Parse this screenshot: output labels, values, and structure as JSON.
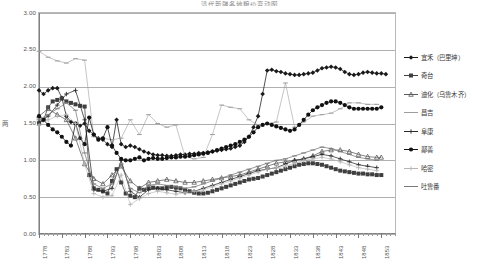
{
  "chart_data": {
    "type": "line",
    "title": "清代新疆各地粮价变动图",
    "xlabel": "",
    "ylabel": "两",
    "ylim": [
      0,
      3.0
    ],
    "xlim": [
      1778,
      1856
    ],
    "grid": true,
    "legend_position": "right",
    "ytick_labels": [
      "0.00",
      "0.50",
      "1.00",
      "1.50",
      "2.00",
      "2.50",
      "3.00"
    ],
    "ytick_values": [
      0.0,
      0.5,
      1.0,
      1.5,
      2.0,
      2.5,
      3.0
    ],
    "xtick_labels": [
      "1778",
      "1783",
      "1788",
      "1793",
      "1798",
      "1803",
      "1808",
      "1813",
      "1818",
      "1823",
      "1828",
      "1833",
      "1838",
      "1843",
      "1848",
      "1853"
    ],
    "xtick_values": [
      1778,
      1783,
      1788,
      1793,
      1798,
      1803,
      1808,
      1813,
      1818,
      1823,
      1828,
      1833,
      1838,
      1843,
      1848,
      1853
    ],
    "series": [
      {
        "name": "宜禾（巴里坤）",
        "marker": "diamond",
        "color": "#1a1a1a",
        "x": [
          1778,
          1779,
          1780,
          1781,
          1782,
          1783,
          1784,
          1785,
          1786,
          1787,
          1788,
          1789,
          1790,
          1791,
          1792,
          1793,
          1794,
          1795,
          1796,
          1797,
          1798,
          1799,
          1800,
          1801,
          1802,
          1803,
          1804,
          1805,
          1806,
          1807,
          1808,
          1809,
          1810,
          1811,
          1812,
          1813,
          1814,
          1815,
          1816,
          1817,
          1818,
          1819,
          1820,
          1821,
          1822,
          1823,
          1824,
          1825,
          1826,
          1827,
          1828,
          1829,
          1830,
          1831,
          1832,
          1833,
          1834,
          1835,
          1836,
          1837,
          1838,
          1839,
          1840,
          1841,
          1842,
          1843,
          1844,
          1845,
          1846,
          1847,
          1848,
          1849,
          1850,
          1851,
          1852,
          1853,
          1854
        ],
        "y": [
          1.95,
          1.9,
          1.95,
          1.98,
          1.98,
          1.85,
          1.6,
          1.52,
          1.5,
          1.47,
          1.5,
          1.4,
          1.35,
          1.3,
          1.28,
          1.22,
          1.18,
          1.55,
          1.22,
          1.18,
          1.2,
          1.18,
          1.15,
          1.12,
          1.1,
          1.08,
          1.07,
          1.07,
          1.06,
          1.06,
          1.07,
          1.08,
          1.08,
          1.09,
          1.09,
          1.1,
          1.1,
          1.11,
          1.12,
          1.13,
          1.14,
          1.15,
          1.16,
          1.18,
          1.2,
          1.25,
          1.32,
          1.45,
          1.6,
          1.9,
          2.22,
          2.23,
          2.21,
          2.2,
          2.18,
          2.17,
          2.16,
          2.16,
          2.17,
          2.18,
          2.19,
          2.22,
          2.25,
          2.26,
          2.27,
          2.26,
          2.24,
          2.2,
          2.17,
          2.16,
          2.17,
          2.19,
          2.2,
          2.19,
          2.18,
          2.18,
          2.17
        ]
      },
      {
        "name": "奇台",
        "marker": "square",
        "color": "#3f3f3f",
        "x": [
          1778,
          1779,
          1780,
          1781,
          1782,
          1783,
          1784,
          1785,
          1786,
          1787,
          1788,
          1789,
          1790,
          1791,
          1792,
          1793,
          1794,
          1795,
          1796,
          1797,
          1798,
          1799,
          1800,
          1801,
          1802,
          1803,
          1804,
          1805,
          1806,
          1807,
          1808,
          1809,
          1810,
          1811,
          1812,
          1813,
          1814,
          1815,
          1816,
          1817,
          1818,
          1819,
          1820,
          1821,
          1822,
          1823,
          1824,
          1825,
          1826,
          1827,
          1828,
          1829,
          1830,
          1831,
          1832,
          1833,
          1834,
          1835,
          1836,
          1837,
          1838,
          1839,
          1840,
          1841,
          1842,
          1843,
          1844,
          1845,
          1846,
          1847,
          1848,
          1849,
          1850,
          1851,
          1852,
          1853
        ],
        "y": [
          1.5,
          1.55,
          1.72,
          1.8,
          1.82,
          1.84,
          1.8,
          1.78,
          1.76,
          1.74,
          1.73,
          0.8,
          0.62,
          0.6,
          0.58,
          0.55,
          0.72,
          0.88,
          0.7,
          0.55,
          0.52,
          0.5,
          0.62,
          0.6,
          0.62,
          0.63,
          0.62,
          0.62,
          0.63,
          0.64,
          0.63,
          0.62,
          0.6,
          0.58,
          0.56,
          0.55,
          0.55,
          0.56,
          0.58,
          0.6,
          0.62,
          0.64,
          0.66,
          0.68,
          0.7,
          0.72,
          0.74,
          0.75,
          0.76,
          0.78,
          0.8,
          0.82,
          0.84,
          0.86,
          0.88,
          0.9,
          0.92,
          0.94,
          0.95,
          0.96,
          0.96,
          0.95,
          0.94,
          0.92,
          0.9,
          0.88,
          0.86,
          0.85,
          0.84,
          0.83,
          0.82,
          0.82,
          0.81,
          0.81,
          0.8,
          0.8
        ]
      },
      {
        "name": "迪化（乌鲁木齐）",
        "marker": "tri-small",
        "color": "#5a5a5a",
        "x": [
          1778,
          1780,
          1782,
          1784,
          1786,
          1788,
          1790,
          1792,
          1794,
          1796,
          1798,
          1800,
          1802,
          1804,
          1806,
          1808,
          1810,
          1812,
          1814,
          1816,
          1818,
          1820,
          1822,
          1824,
          1826,
          1828,
          1830,
          1832,
          1834,
          1836,
          1838,
          1840,
          1842,
          1844,
          1846,
          1848,
          1850,
          1852,
          1853
        ],
        "y": [
          1.6,
          1.7,
          1.62,
          1.55,
          1.3,
          0.95,
          0.75,
          0.68,
          0.8,
          0.92,
          0.72,
          0.62,
          0.7,
          0.72,
          0.74,
          0.72,
          0.7,
          0.7,
          0.72,
          0.74,
          0.76,
          0.78,
          0.8,
          0.84,
          0.88,
          0.92,
          0.96,
          0.98,
          1.0,
          1.02,
          1.06,
          1.12,
          1.14,
          1.14,
          1.12,
          1.08,
          1.05,
          1.04,
          1.04
        ]
      },
      {
        "name": "昌吉",
        "marker": "faint-dash",
        "color": "#9d9d9d",
        "x": [
          1778,
          1780,
          1782,
          1784,
          1786,
          1788,
          1790,
          1792,
          1794,
          1796,
          1798,
          1800,
          1802,
          1804,
          1806,
          1808,
          1810,
          1812,
          1814,
          1816,
          1818,
          1820,
          1822,
          1824,
          1826,
          1828,
          1830,
          1832,
          1834,
          1836,
          1838,
          1840,
          1842,
          1844,
          1846,
          1848,
          1850,
          1852
        ],
        "y": [
          2.48,
          2.4,
          2.35,
          2.32,
          2.38,
          2.36,
          1.32,
          1.3,
          1.28,
          1.3,
          1.55,
          1.35,
          1.62,
          1.5,
          1.45,
          1.48,
          1.05,
          1.02,
          1.04,
          1.35,
          1.75,
          1.72,
          1.7,
          1.55,
          1.48,
          1.5,
          1.52,
          2.05,
          1.45,
          1.52,
          1.6,
          1.62,
          1.64,
          1.7,
          1.78,
          1.78,
          1.76,
          1.76
        ]
      },
      {
        "name": "阜康",
        "marker": "plus",
        "color": "#2b2b2b",
        "x": [
          1778,
          1780,
          1782,
          1784,
          1786,
          1788,
          1790,
          1792,
          1794,
          1796,
          1798,
          1800,
          1802,
          1804,
          1806,
          1808,
          1810,
          1812,
          1814,
          1816,
          1818,
          1820,
          1822,
          1824,
          1826,
          1828,
          1830,
          1832,
          1834,
          1836,
          1838,
          1840,
          1842,
          1844,
          1846,
          1848,
          1850,
          1852
        ],
        "y": [
          1.52,
          1.6,
          1.75,
          1.9,
          1.95,
          1.55,
          0.6,
          0.58,
          0.62,
          1.0,
          0.58,
          0.5,
          0.6,
          0.62,
          0.6,
          0.58,
          0.56,
          0.58,
          0.62,
          0.66,
          0.7,
          0.74,
          0.78,
          0.82,
          0.86,
          0.88,
          0.9,
          0.95,
          1.0,
          1.02,
          1.05,
          1.08,
          1.06,
          1.02,
          0.98,
          0.94,
          0.92,
          0.9
        ]
      },
      {
        "name": "鄯善",
        "marker": "circle",
        "color": "#111111",
        "x": [
          1778,
          1779,
          1780,
          1781,
          1782,
          1783,
          1784,
          1785,
          1786,
          1787,
          1788,
          1789,
          1790,
          1791,
          1792,
          1793,
          1794,
          1795,
          1796,
          1797,
          1798,
          1799,
          1800,
          1801,
          1802,
          1803,
          1804,
          1805,
          1806,
          1807,
          1808,
          1809,
          1810,
          1811,
          1812,
          1813,
          1814,
          1815,
          1816,
          1817,
          1818,
          1819,
          1820,
          1821,
          1822,
          1823,
          1824,
          1825,
          1826,
          1827,
          1828,
          1829,
          1830,
          1831,
          1832,
          1833,
          1834,
          1835,
          1836,
          1837,
          1838,
          1839,
          1840,
          1841,
          1842,
          1843,
          1844,
          1845,
          1846,
          1847,
          1848,
          1849,
          1850,
          1851,
          1852,
          1853
        ],
        "y": [
          1.6,
          1.55,
          1.48,
          1.42,
          1.38,
          1.32,
          1.25,
          1.2,
          1.5,
          1.3,
          1.22,
          1.58,
          1.35,
          1.28,
          1.3,
          1.45,
          1.2,
          1.1,
          1.02,
          1.0,
          1.0,
          1.02,
          1.04,
          1.0,
          1.02,
          1.03,
          1.02,
          1.02,
          1.03,
          1.04,
          1.04,
          1.05,
          1.05,
          1.06,
          1.07,
          1.08,
          1.09,
          1.1,
          1.12,
          1.14,
          1.16,
          1.18,
          1.2,
          1.22,
          1.25,
          1.28,
          1.32,
          1.38,
          1.45,
          1.48,
          1.5,
          1.48,
          1.46,
          1.44,
          1.42,
          1.4,
          1.42,
          1.48,
          1.55,
          1.62,
          1.68,
          1.72,
          1.75,
          1.78,
          1.8,
          1.8,
          1.78,
          1.75,
          1.72,
          1.7,
          1.7,
          1.7,
          1.7,
          1.7,
          1.7,
          1.72
        ]
      },
      {
        "name": "哈密",
        "marker": "light-cross",
        "color": "#b5b5b5",
        "x": [
          1778,
          1780,
          1782,
          1784,
          1786,
          1788,
          1790,
          1792,
          1794,
          1796,
          1798,
          1800,
          1802,
          1804,
          1806,
          1808,
          1810,
          1812,
          1814,
          1816,
          1818,
          1820,
          1822,
          1824,
          1826,
          1828,
          1830,
          1832,
          1834,
          1836,
          1838,
          1840,
          1842,
          1844,
          1846,
          1848,
          1850,
          1852
        ],
        "y": [
          1.48,
          1.55,
          1.6,
          1.62,
          1.5,
          0.95,
          0.55,
          0.5,
          0.52,
          0.8,
          0.4,
          0.48,
          0.55,
          0.58,
          0.56,
          0.54,
          0.56,
          0.58,
          0.6,
          0.64,
          0.68,
          0.72,
          0.76,
          0.8,
          0.84,
          0.88,
          0.9,
          0.92,
          0.96,
          1.0,
          1.02,
          1.04,
          1.02,
          0.98,
          0.94,
          0.9,
          0.88,
          0.86
        ]
      },
      {
        "name": "吐鲁番",
        "marker": "dash",
        "color": "#7a7a7a",
        "x": [
          1778,
          1780,
          1782,
          1784,
          1786,
          1788,
          1790,
          1792,
          1794,
          1796,
          1798,
          1800,
          1802,
          1804,
          1806,
          1808,
          1810,
          1812,
          1814,
          1816,
          1818,
          1820,
          1822,
          1824,
          1826,
          1828,
          1830,
          1832,
          1834,
          1836,
          1838,
          1840,
          1842,
          1844,
          1846,
          1848,
          1850,
          1852
        ],
        "y": [
          1.55,
          1.62,
          1.7,
          1.78,
          1.68,
          1.1,
          0.68,
          0.62,
          0.68,
          0.95,
          0.62,
          0.56,
          0.66,
          0.68,
          0.66,
          0.64,
          0.62,
          0.64,
          0.68,
          0.72,
          0.76,
          0.8,
          0.84,
          0.88,
          0.92,
          0.96,
          1.0,
          1.02,
          1.06,
          1.1,
          1.14,
          1.18,
          1.16,
          1.12,
          1.08,
          1.04,
          1.02,
          1.0
        ]
      }
    ]
  }
}
